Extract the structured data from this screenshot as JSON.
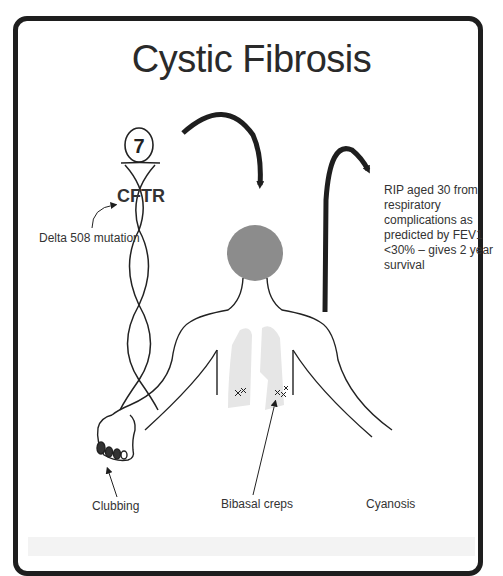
{
  "title": "Cystic Fibrosis",
  "chromosome": {
    "number": "7",
    "gene": "CFTR"
  },
  "labels": {
    "mutation": "Delta 508 mutation",
    "prognosis": "RIP aged 30 from respiratory complications as predicted by FEV1 <30% – gives 2 year survival",
    "clubbing": "Clubbing",
    "bibasal_creps": "Bibasal creps",
    "cyanosis": "Cyanosis"
  },
  "colors": {
    "border": "#1e1e1e",
    "head": "#8c8c8c",
    "lungs": "#e6e6e6",
    "text": "#333333"
  }
}
